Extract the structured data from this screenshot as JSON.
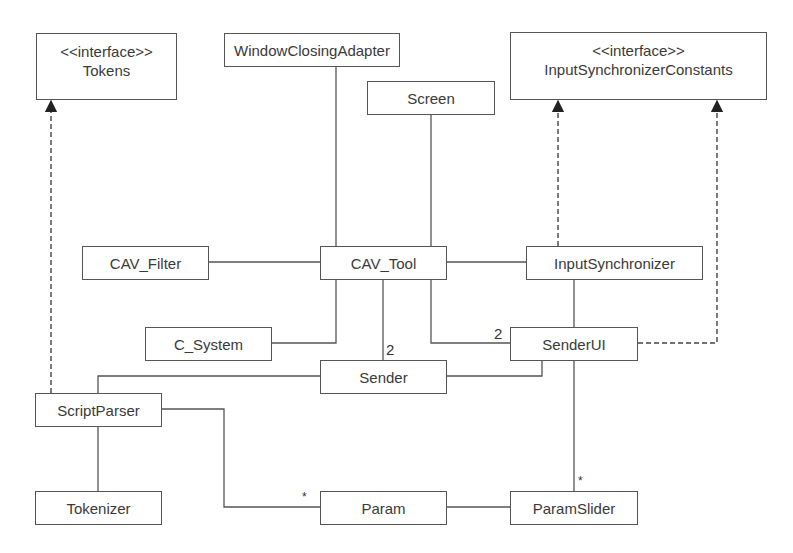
{
  "diagram": {
    "type": "UML class diagram",
    "classes": {
      "tokens": {
        "stereotype": "<<interface>>",
        "name": "Tokens"
      },
      "window_closing_adapter": {
        "name": "WindowClosingAdapter"
      },
      "screen": {
        "name": "Screen"
      },
      "input_sync_constants": {
        "stereotype": "<<interface>>",
        "name": "InputSynchronizerConstants"
      },
      "cav_filter": {
        "name": "CAV_Filter"
      },
      "cav_tool": {
        "name": "CAV_Tool"
      },
      "input_synchronizer": {
        "name": "InputSynchronizer"
      },
      "c_system": {
        "name": "C_System"
      },
      "sender_ui": {
        "name": "SenderUI"
      },
      "sender": {
        "name": "Sender"
      },
      "script_parser": {
        "name": "ScriptParser"
      },
      "tokenizer": {
        "name": "Tokenizer"
      },
      "param": {
        "name": "Param"
      },
      "param_slider": {
        "name": "ParamSlider"
      }
    },
    "multiplicities": {
      "cav_tool_sender": "2",
      "cav_tool_sender_ui": "2",
      "input_sync_sender_ui": "2",
      "script_parser_param": "*",
      "sender_ui_param_slider": "*"
    },
    "relationships": [
      {
        "from": "ScriptParser",
        "to": "Tokens",
        "kind": "realization"
      },
      {
        "from": "InputSynchronizer",
        "to": "InputSynchronizerConstants",
        "kind": "realization"
      },
      {
        "from": "SenderUI",
        "to": "InputSynchronizerConstants",
        "kind": "realization"
      },
      {
        "from": "CAV_Tool",
        "to": "WindowClosingAdapter",
        "kind": "association"
      },
      {
        "from": "CAV_Tool",
        "to": "Screen",
        "kind": "association"
      },
      {
        "from": "CAV_Tool",
        "to": "CAV_Filter",
        "kind": "association"
      },
      {
        "from": "CAV_Tool",
        "to": "InputSynchronizer",
        "kind": "association"
      },
      {
        "from": "CAV_Tool",
        "to": "C_System",
        "kind": "association"
      },
      {
        "from": "CAV_Tool",
        "to": "Sender",
        "kind": "association",
        "multiplicity": "2"
      },
      {
        "from": "CAV_Tool",
        "to": "SenderUI",
        "kind": "association",
        "multiplicity": "2"
      },
      {
        "from": "InputSynchronizer",
        "to": "SenderUI",
        "kind": "association",
        "multiplicity": "2"
      },
      {
        "from": "Sender",
        "to": "SenderUI",
        "kind": "association"
      },
      {
        "from": "Sender",
        "to": "ScriptParser",
        "kind": "association"
      },
      {
        "from": "ScriptParser",
        "to": "Tokenizer",
        "kind": "association"
      },
      {
        "from": "ScriptParser",
        "to": "Param",
        "kind": "association",
        "multiplicity": "*"
      },
      {
        "from": "SenderUI",
        "to": "ParamSlider",
        "kind": "association",
        "multiplicity": "*"
      },
      {
        "from": "Param",
        "to": "ParamSlider",
        "kind": "association"
      }
    ]
  },
  "colors": {
    "line": "#555555",
    "text": "#3a3a3a",
    "background": "#ffffff"
  }
}
